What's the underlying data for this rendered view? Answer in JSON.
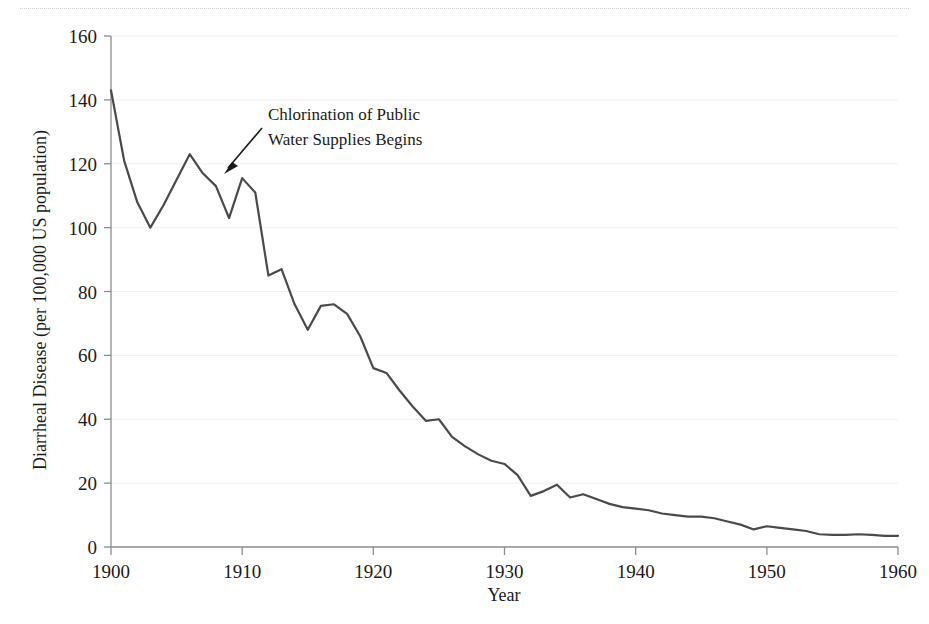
{
  "figure": {
    "background_color": "#ffffff",
    "line_color": "#4a4a4a",
    "grid_color": "#f0f0f2",
    "axis_color": "#8c8c8c",
    "text_color": "#1a1a1a",
    "top_rule": "dotted-scan-edge"
  },
  "annotation": {
    "line1": "Chlorination of Public",
    "line2": "Water Supplies Begins",
    "arrow": "arrow-pointing-down-left",
    "target_year": 1908
  },
  "chart_data": {
    "type": "line",
    "title": "",
    "xlabel": "Year",
    "ylabel": "Diarrheal Disease (per 100,000 US population)",
    "xlim": [
      1900,
      1960
    ],
    "ylim": [
      0,
      160
    ],
    "xticks": [
      1900,
      1910,
      1920,
      1930,
      1940,
      1950,
      1960
    ],
    "xticklabels": [
      "1900",
      "1910",
      "1920",
      "1930",
      "1940",
      "1950",
      "1960"
    ],
    "yticks": [
      0,
      20,
      40,
      60,
      80,
      100,
      120,
      140,
      160
    ],
    "yticklabels": [
      "0",
      "20",
      "40",
      "60",
      "80",
      "100",
      "120",
      "140",
      "160"
    ],
    "grid": "horizontal-only",
    "legend": "none",
    "series_name": "Diarrheal disease death rate",
    "x": [
      1900,
      1901,
      1902,
      1903,
      1904,
      1905,
      1906,
      1907,
      1908,
      1909,
      1910,
      1911,
      1912,
      1913,
      1914,
      1915,
      1916,
      1917,
      1918,
      1919,
      1920,
      1921,
      1922,
      1923,
      1924,
      1925,
      1926,
      1927,
      1928,
      1929,
      1930,
      1931,
      1932,
      1933,
      1934,
      1935,
      1936,
      1937,
      1938,
      1939,
      1940,
      1941,
      1942,
      1943,
      1944,
      1945,
      1946,
      1947,
      1948,
      1949,
      1950,
      1951,
      1952,
      1953,
      1954,
      1955,
      1956,
      1957,
      1958,
      1959,
      1960
    ],
    "y": [
      143.0,
      121.0,
      108.0,
      100.0,
      107.0,
      115.0,
      123.0,
      117.0,
      113.0,
      103.0,
      115.5,
      111.0,
      85.0,
      87.0,
      76.0,
      68.0,
      75.5,
      76.0,
      73.0,
      66.0,
      56.0,
      54.5,
      49.0,
      44.0,
      39.5,
      40.0,
      34.5,
      31.5,
      29.0,
      27.0,
      26.0,
      22.5,
      16.0,
      17.5,
      19.5,
      15.5,
      16.5,
      15.0,
      13.5,
      12.5,
      12.0,
      11.5,
      10.5,
      10.0,
      9.5,
      9.5,
      9.0,
      8.0,
      7.0,
      5.5,
      6.5,
      6.0,
      5.5,
      5.0,
      4.0,
      3.8,
      3.8,
      4.0,
      3.8,
      3.5,
      3.5
    ]
  }
}
